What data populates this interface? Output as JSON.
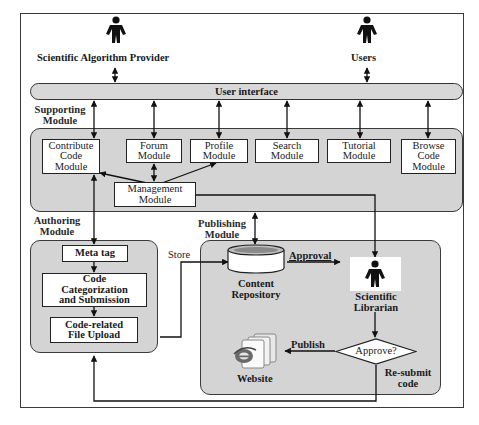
{
  "diagram": {
    "type": "system architecture / flow diagram",
    "actors": {
      "provider": "Scientific Algorithm Provider",
      "users": "Users",
      "librarian_line1": "Scientific",
      "librarian_line2": "Librarian"
    },
    "user_interface": "User interface",
    "supporting_module": {
      "label_line1": "Supporting",
      "label_line2": "Module",
      "modules": [
        {
          "id": "contribute",
          "lines": [
            "Contribute",
            "Code",
            "Module"
          ]
        },
        {
          "id": "forum",
          "lines": [
            "Forum",
            "Module"
          ]
        },
        {
          "id": "profile",
          "lines": [
            "Profile",
            "Module"
          ]
        },
        {
          "id": "search",
          "lines": [
            "Search",
            "Module"
          ]
        },
        {
          "id": "tutorial",
          "lines": [
            "Tutorial",
            "Module"
          ]
        },
        {
          "id": "browse",
          "lines": [
            "Browse",
            "Code",
            "Module"
          ]
        }
      ],
      "management": {
        "lines": [
          "Management",
          "Module"
        ]
      }
    },
    "authoring_module": {
      "label_line1": "Authoring",
      "label_line2": "Module",
      "steps": [
        {
          "id": "meta",
          "lines": [
            "Meta tag"
          ]
        },
        {
          "id": "categorization",
          "lines": [
            "Code",
            "Categorization",
            "and Submission"
          ]
        },
        {
          "id": "upload",
          "lines": [
            "Code-related",
            "File Upload"
          ]
        }
      ]
    },
    "publishing_module": {
      "label_line1": "Publishing",
      "label_line2": "Module",
      "repository_line1": "Content",
      "repository_line2": "Repository",
      "decision": "Approve?",
      "website": "Website"
    },
    "edge_labels": {
      "store": "Store",
      "approval": "Approval",
      "publish": "Publish",
      "resubmit_line1": "Re-submit",
      "resubmit_line2": "code"
    },
    "edges": [
      {
        "from": "Scientific Algorithm Provider",
        "to": "User interface",
        "dir": "both"
      },
      {
        "from": "Users",
        "to": "User interface",
        "dir": "both"
      },
      {
        "from": "User interface",
        "to": "Contribute Code Module",
        "dir": "both"
      },
      {
        "from": "User interface",
        "to": "Forum Module",
        "dir": "both"
      },
      {
        "from": "User interface",
        "to": "Profile Module",
        "dir": "both"
      },
      {
        "from": "User interface",
        "to": "Search Module",
        "dir": "both"
      },
      {
        "from": "User interface",
        "to": "Tutorial Module",
        "dir": "both"
      },
      {
        "from": "User interface",
        "to": "Browse Code Module",
        "dir": "both"
      },
      {
        "from": "Management Module",
        "to": "Contribute Code Module",
        "dir": "forward"
      },
      {
        "from": "Management Module",
        "to": "Forum Module",
        "dir": "both"
      },
      {
        "from": "Management Module",
        "to": "Profile Module",
        "dir": "forward"
      },
      {
        "from": "Management Module",
        "to": "Scientific Librarian",
        "dir": "forward"
      },
      {
        "from": "Contribute Code Module",
        "to": "Meta tag",
        "dir": "both"
      },
      {
        "from": "Meta tag",
        "to": "Code Categorization and Submission",
        "dir": "forward"
      },
      {
        "from": "Code Categorization and Submission",
        "to": "Code-related File Upload",
        "dir": "forward"
      },
      {
        "from": "Code-related File Upload",
        "to": "Content Repository",
        "label": "Store",
        "dir": "forward"
      },
      {
        "from": "Supporting Module",
        "to": "Content Repository",
        "dir": "both"
      },
      {
        "from": "Content Repository",
        "to": "Scientific Librarian",
        "label": "Approval",
        "dir": "forward"
      },
      {
        "from": "Scientific Librarian",
        "to": "Approve?",
        "dir": "forward"
      },
      {
        "from": "Approve?",
        "to": "Website",
        "label": "Publish",
        "dir": "forward"
      },
      {
        "from": "Approve?",
        "to": "Code-related File Upload",
        "label": "Re-submit code",
        "dir": "forward"
      }
    ]
  }
}
